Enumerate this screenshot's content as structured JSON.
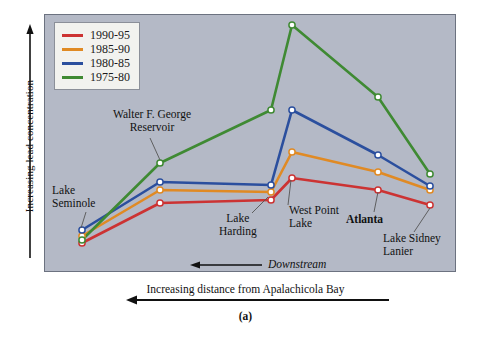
{
  "figure": {
    "caption": "(a)",
    "y_axis_label": "Increasing lead concentration",
    "x_axis_label": "Increasing distance from Apalachicola Bay",
    "downstream_note": "Downstream",
    "plot_background_color": "#b4b9c6",
    "plot_border_color": "#6c7280",
    "page_background_color": "#ffffff"
  },
  "legend": {
    "entries": [
      {
        "label": "1990-95",
        "color": "#cc3333"
      },
      {
        "label": "1985-90",
        "color": "#e08a24"
      },
      {
        "label": "1980-85",
        "color": "#2b4f9e"
      },
      {
        "label": "1975-80",
        "color": "#3f8a33"
      }
    ]
  },
  "point_labels": [
    {
      "name": "Lake Seminole",
      "line1": "Lake",
      "line2": "Seminole"
    },
    {
      "name": "Walter F. George Reservoir",
      "line1": "Walter F. George",
      "line2": "Reservoir"
    },
    {
      "name": "Lake Harding",
      "line1": "Lake",
      "line2": "Harding"
    },
    {
      "name": "West Point Lake",
      "line1": "West Point",
      "line2": "Lake"
    },
    {
      "name": "Atlanta",
      "line1": "Atlanta",
      "line2": ""
    },
    {
      "name": "Lake Sidney Lanier",
      "line1": "Lake Sidney",
      "line2": "Lanier"
    }
  ],
  "chart_data": {
    "type": "line",
    "title": "",
    "subtitle": "",
    "xlabel": "Increasing distance from Apalachicola Bay",
    "ylabel": "Increasing lead concentration",
    "grid": false,
    "legend_position": "top-left",
    "axes_note": "Both axes are qualitative (unlabeled, arrow-annotated): y increases upward with lead concentration, x increases leftward with distance from Apalachicola Bay; downstream direction is to the left.",
    "categories": [
      "Lake Seminole",
      "Walter F. George Reservoir",
      "Lake Harding",
      "West Point Lake",
      "Atlanta",
      "Lake Sidney Lanier"
    ],
    "x_positions": [
      82,
      160,
      271,
      292,
      378,
      430
    ],
    "ylim": [
      0,
      100
    ],
    "series": [
      {
        "name": "1975-80",
        "color": "#3f8a33",
        "values": [
          12,
          43,
          65,
          97,
          63,
          40
        ],
        "pixel_y": [
          240,
          163,
          110,
          25,
          97,
          174
        ]
      },
      {
        "name": "1980-85",
        "color": "#2b4f9e",
        "values": [
          17,
          34,
          33,
          65,
          44,
          35
        ],
        "pixel_y": [
          230,
          182,
          185,
          110,
          155,
          186
        ]
      },
      {
        "name": "1985-90",
        "color": "#e08a24",
        "values": [
          14,
          31,
          30,
          48,
          38,
          33
        ],
        "pixel_y": [
          236,
          190,
          192,
          152,
          172,
          190
        ]
      },
      {
        "name": "1990-95",
        "color": "#cc3333",
        "values": [
          11,
          26,
          25,
          38,
          31,
          27
        ],
        "pixel_y": [
          243,
          203,
          200,
          178,
          190,
          205
        ]
      }
    ]
  }
}
